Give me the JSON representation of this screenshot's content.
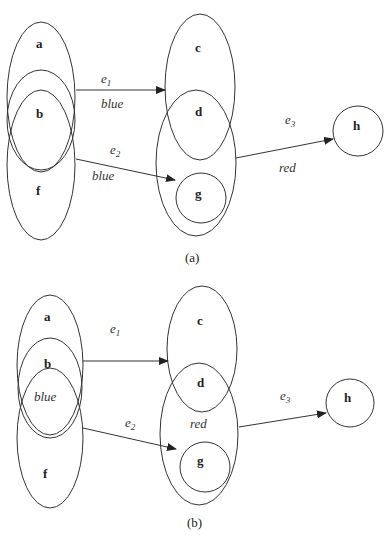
{
  "diagram_a": {
    "caption": "(a)",
    "nodes": {
      "a": "a",
      "b": "b",
      "c": "c",
      "d": "d",
      "f": "f",
      "g": "g",
      "h": "h"
    },
    "edges": [
      {
        "name": "e1",
        "sub": "1",
        "color_label": "blue"
      },
      {
        "name": "e2",
        "sub": "2",
        "color_label": "blue"
      },
      {
        "name": "e3",
        "sub": "3",
        "color_label": "red"
      }
    ]
  },
  "diagram_b": {
    "caption": "(b)",
    "nodes": {
      "a": "a",
      "b": "b",
      "c": "c",
      "d": "d",
      "f": "f",
      "g": "g",
      "h": "h"
    },
    "set_labels": {
      "left": "blue",
      "right": "red"
    },
    "edges": [
      {
        "name": "e1",
        "sub": "1"
      },
      {
        "name": "e2",
        "sub": "2"
      },
      {
        "name": "e3",
        "sub": "3"
      }
    ]
  }
}
